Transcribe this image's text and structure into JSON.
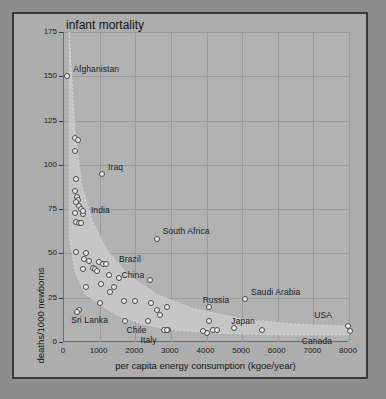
{
  "chart_data": {
    "type": "scatter",
    "title": "infant mortality",
    "xlabel": "per capita energy consumption (kgoe/year)",
    "ylabel": "deaths/1000 newborns",
    "xlim": [
      0,
      8000
    ],
    "ylim": [
      0,
      175
    ],
    "xticks": [
      0,
      1000,
      2000,
      3000,
      4000,
      5000,
      6000,
      7000,
      8000
    ],
    "yticks": [
      0,
      25,
      50,
      75,
      100,
      125,
      150,
      175
    ],
    "grid": true,
    "legend": "none",
    "annotation": "Shaded band envelope encloses the downward hyperbolic trend of the country points.",
    "labeled_points": [
      {
        "label": "Afghanistan",
        "x": 90,
        "y": 150,
        "label_dx": 6,
        "label_dy": -8
      },
      {
        "label": "Iraq",
        "x": 1070,
        "y": 95,
        "label_dx": 6,
        "label_dy": -8
      },
      {
        "label": "India",
        "x": 530,
        "y": 74,
        "label_dx": 8,
        "label_dy": -2
      },
      {
        "label": "South Africa",
        "x": 2600,
        "y": 58,
        "label_dx": 6,
        "label_dy": -9
      },
      {
        "label": "Brazil",
        "x": 1180,
        "y": 44,
        "label_dx": 13,
        "label_dy": -6
      },
      {
        "label": "China",
        "x": 1250,
        "y": 38,
        "label_dx": 13,
        "label_dy": -1
      },
      {
        "label": "Sri Lanka",
        "x": 370,
        "y": 17,
        "label_dx": -6,
        "label_dy": 7
      },
      {
        "label": "Chile",
        "x": 1700,
        "y": 12,
        "label_dx": 2,
        "label_dy": 8
      },
      {
        "label": "Italy",
        "x": 2880,
        "y": 7,
        "label_dx": -26,
        "label_dy": 9
      },
      {
        "label": "Russia",
        "x": 4060,
        "y": 20,
        "label_dx": -6,
        "label_dy": -8
      },
      {
        "label": "Saudi Arabia",
        "x": 5080,
        "y": 24,
        "label_dx": 6,
        "label_dy": -8
      },
      {
        "label": "Japan",
        "x": 4780,
        "y": 8,
        "label_dx": -3,
        "label_dy": -8
      },
      {
        "label": "USA",
        "x": 7980,
        "y": 9,
        "label_dx": -34,
        "label_dy": -12
      },
      {
        "label": "Canada",
        "x": 8020,
        "y": 6,
        "label_dx": -48,
        "label_dy": 9
      }
    ],
    "unlabeled_points": [
      {
        "x": 300,
        "y": 115
      },
      {
        "x": 380,
        "y": 114
      },
      {
        "x": 300,
        "y": 108
      },
      {
        "x": 340,
        "y": 92
      },
      {
        "x": 300,
        "y": 85
      },
      {
        "x": 360,
        "y": 82
      },
      {
        "x": 400,
        "y": 80
      },
      {
        "x": 330,
        "y": 79
      },
      {
        "x": 430,
        "y": 77
      },
      {
        "x": 470,
        "y": 75
      },
      {
        "x": 300,
        "y": 73
      },
      {
        "x": 520,
        "y": 72
      },
      {
        "x": 330,
        "y": 68
      },
      {
        "x": 430,
        "y": 67
      },
      {
        "x": 480,
        "y": 67
      },
      {
        "x": 330,
        "y": 51
      },
      {
        "x": 620,
        "y": 50
      },
      {
        "x": 560,
        "y": 47
      },
      {
        "x": 700,
        "y": 46
      },
      {
        "x": 980,
        "y": 45
      },
      {
        "x": 1100,
        "y": 44
      },
      {
        "x": 530,
        "y": 41
      },
      {
        "x": 800,
        "y": 42
      },
      {
        "x": 880,
        "y": 41
      },
      {
        "x": 940,
        "y": 40
      },
      {
        "x": 1530,
        "y": 36
      },
      {
        "x": 2420,
        "y": 35
      },
      {
        "x": 1050,
        "y": 33
      },
      {
        "x": 620,
        "y": 31
      },
      {
        "x": 1400,
        "y": 31
      },
      {
        "x": 1300,
        "y": 28
      },
      {
        "x": 1000,
        "y": 22
      },
      {
        "x": 1680,
        "y": 23
      },
      {
        "x": 1980,
        "y": 23
      },
      {
        "x": 2440,
        "y": 22
      },
      {
        "x": 2880,
        "y": 20
      },
      {
        "x": 2600,
        "y": 18
      },
      {
        "x": 420,
        "y": 18
      },
      {
        "x": 2700,
        "y": 15
      },
      {
        "x": 2350,
        "y": 12
      },
      {
        "x": 4060,
        "y": 12
      },
      {
        "x": 4000,
        "y": 5
      },
      {
        "x": 4180,
        "y": 7
      },
      {
        "x": 4300,
        "y": 7
      },
      {
        "x": 5560,
        "y": 7
      },
      {
        "x": 2800,
        "y": 7
      },
      {
        "x": 2920,
        "y": 7
      },
      {
        "x": 3900,
        "y": 6
      }
    ],
    "band_upper": [
      {
        "x": 150,
        "y": 175
      },
      {
        "x": 300,
        "y": 120
      },
      {
        "x": 500,
        "y": 88
      },
      {
        "x": 800,
        "y": 68
      },
      {
        "x": 1200,
        "y": 52
      },
      {
        "x": 1800,
        "y": 38
      },
      {
        "x": 2600,
        "y": 27
      },
      {
        "x": 3600,
        "y": 19
      },
      {
        "x": 5000,
        "y": 13
      },
      {
        "x": 6500,
        "y": 10
      },
      {
        "x": 8000,
        "y": 9
      }
    ],
    "band_lower": [
      {
        "x": 150,
        "y": 60
      },
      {
        "x": 300,
        "y": 40
      },
      {
        "x": 600,
        "y": 27
      },
      {
        "x": 1000,
        "y": 21
      },
      {
        "x": 1500,
        "y": 15
      },
      {
        "x": 2200,
        "y": 10
      },
      {
        "x": 3000,
        "y": 7
      },
      {
        "x": 4200,
        "y": 5
      },
      {
        "x": 6000,
        "y": 4
      },
      {
        "x": 8000,
        "y": 4
      }
    ]
  },
  "figure": {
    "background_color": "#8d8d8d",
    "panel_color": "#adadad",
    "plot_color": "#b2b2b2",
    "band_color": "#c6c6c6",
    "grid_color": "#9a9a9a",
    "point_fill": "#e8e8e8",
    "point_stroke": "#4a4a4a",
    "text_color": "#1b1b1b",
    "frame_color": "#3a3a3a"
  }
}
